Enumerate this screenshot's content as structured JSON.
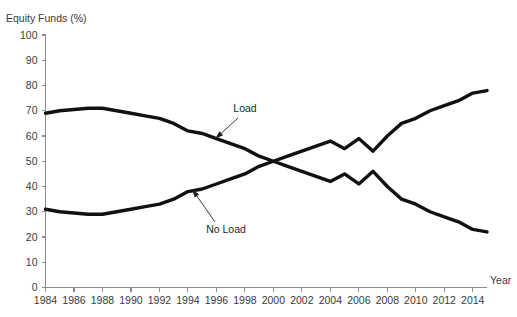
{
  "chart_data": {
    "type": "line",
    "title": "Equity Funds (%)",
    "xlabel": "Year",
    "ylabel": "Equity Funds (%)",
    "xlim": [
      1984,
      2015
    ],
    "ylim": [
      0,
      100
    ],
    "grid": false,
    "legend_position": "inline-annotations",
    "y_ticks": [
      0,
      10,
      20,
      30,
      40,
      50,
      60,
      70,
      80,
      90,
      100
    ],
    "y_tick_labels": [
      "0",
      "10",
      "20",
      "30",
      "40",
      "50",
      "60",
      "70",
      "80",
      "90",
      "100"
    ],
    "x_ticks": [
      1984,
      1986,
      1988,
      1990,
      1992,
      1994,
      1996,
      1998,
      2000,
      2002,
      2004,
      2006,
      2008,
      2010,
      2012,
      2014
    ],
    "x_tick_labels": [
      "1984",
      "1986",
      "1988",
      "1990",
      "1992",
      "1994",
      "1996",
      "1998",
      "2000",
      "2002",
      "2004",
      "2006",
      "2008",
      "2010",
      "2012",
      "2014"
    ],
    "x": [
      1984,
      1985,
      1986,
      1987,
      1988,
      1989,
      1990,
      1991,
      1992,
      1993,
      1994,
      1995,
      1996,
      1997,
      1998,
      1999,
      2000,
      2001,
      2002,
      2003,
      2004,
      2005,
      2006,
      2007,
      2008,
      2009,
      2010,
      2011,
      2012,
      2013,
      2014,
      2015
    ],
    "series": [
      {
        "name": "Load",
        "color": "#111111",
        "values": [
          69,
          70,
          70.5,
          71,
          71,
          70,
          69,
          68,
          67,
          65,
          62,
          61,
          59,
          57,
          55,
          52,
          50,
          48,
          46,
          44,
          42,
          45,
          41,
          46,
          40,
          35,
          33,
          30,
          28,
          26,
          23,
          22
        ]
      },
      {
        "name": "No Load",
        "color": "#111111",
        "values": [
          31,
          30,
          29.5,
          29,
          29,
          30,
          31,
          32,
          33,
          35,
          38,
          39,
          41,
          43,
          45,
          48,
          50,
          52,
          54,
          56,
          58,
          55,
          59,
          54,
          60,
          65,
          67,
          70,
          72,
          74,
          77,
          78
        ]
      }
    ],
    "annotations": [
      {
        "text": "Load",
        "label_x": 245,
        "label_y": 112,
        "arrow_from_x": 238,
        "arrow_from_y": 118,
        "arrow_to_x": 215,
        "arrow_to_y": 139
      },
      {
        "text": "No Load",
        "label_x": 226,
        "label_y": 233,
        "arrow_from_x": 215,
        "arrow_from_y": 222,
        "arrow_to_x": 192,
        "arrow_to_y": 189
      }
    ]
  },
  "axis_title": {
    "year": "Year"
  }
}
